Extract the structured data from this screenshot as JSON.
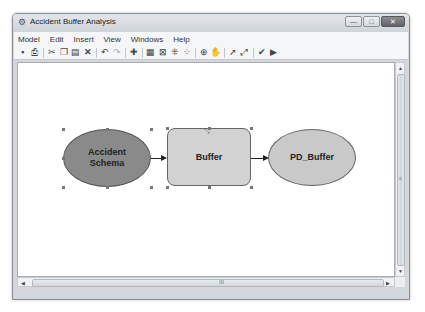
{
  "window": {
    "title": "Accident Buffer Analysis",
    "icon": "model-builder-icon",
    "controls": {
      "minimize": "—",
      "maximize": "□",
      "close": "✕"
    }
  },
  "menubar": {
    "items": [
      "Model",
      "Edit",
      "Insert",
      "View",
      "Windows",
      "Help"
    ]
  },
  "toolbar": {
    "buttons": [
      {
        "name": "save-icon",
        "glyph": "▪"
      },
      {
        "name": "print-icon",
        "glyph": "⎙"
      },
      {
        "name": "sep"
      },
      {
        "name": "cut-icon",
        "glyph": "✂"
      },
      {
        "name": "copy-icon",
        "glyph": "❐"
      },
      {
        "name": "paste-icon",
        "glyph": "▤"
      },
      {
        "name": "delete-icon",
        "glyph": "✕"
      },
      {
        "name": "sep"
      },
      {
        "name": "undo-icon",
        "glyph": "↶"
      },
      {
        "name": "redo-icon",
        "glyph": "↷"
      },
      {
        "name": "sep"
      },
      {
        "name": "add-data-icon",
        "glyph": "✚"
      },
      {
        "name": "sep"
      },
      {
        "name": "auto-layout-icon",
        "glyph": "▦"
      },
      {
        "name": "full-extent-icon",
        "glyph": "⊠"
      },
      {
        "name": "fixed-zoom-in-icon",
        "glyph": "⁜"
      },
      {
        "name": "fixed-zoom-out-icon",
        "glyph": "⁘"
      },
      {
        "name": "sep"
      },
      {
        "name": "zoom-in-icon",
        "glyph": "⊕"
      },
      {
        "name": "pan-icon",
        "glyph": "✋"
      },
      {
        "name": "sep"
      },
      {
        "name": "select-icon",
        "glyph": "➚"
      },
      {
        "name": "connect-icon",
        "glyph": "⤢"
      },
      {
        "name": "sep"
      },
      {
        "name": "validate-icon",
        "glyph": "✔"
      },
      {
        "name": "run-icon",
        "glyph": "▶"
      }
    ]
  },
  "diagram": {
    "nodes": [
      {
        "id": "accident-schema",
        "label_line1": "Accident",
        "label_line2": "Schema",
        "shape": "ellipse",
        "fill": "#8a8a8a"
      },
      {
        "id": "buffer",
        "label": "Buffer",
        "shape": "rounded-rect",
        "fill": "#d2d2d2"
      },
      {
        "id": "pd-buffer",
        "label": "PD_Buffer",
        "shape": "ellipse",
        "fill": "#c9c9c9"
      }
    ]
  },
  "scrollbars": {
    "v_up": "▲",
    "v_down": "▼",
    "v_grip": "≡",
    "h_left": "◀",
    "h_right": "▶",
    "h_grip": "III"
  }
}
